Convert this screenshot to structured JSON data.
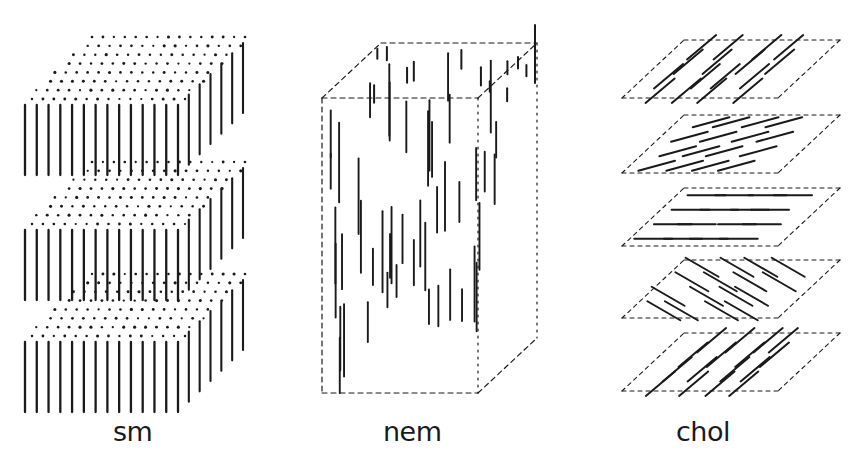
{
  "figure": {
    "ink_color": "#1a1a1a",
    "background": "#ffffff"
  },
  "panels": [
    {
      "id": "smectic",
      "label": "sm",
      "label_pos": [
        113,
        418
      ],
      "layers": 3,
      "layer_tops": [
        43,
        168,
        280
      ],
      "layer_height": 70,
      "front_x": [
        25,
        178
      ],
      "depth_dx": 65,
      "depth_dy": -62,
      "front_rods": 14,
      "side_rods": 6
    },
    {
      "id": "nematic",
      "label": "nem",
      "label_pos": [
        383,
        418
      ],
      "box_front": {
        "x": 322,
        "y": 98,
        "w": 156,
        "h": 295
      },
      "depth_dx": 59,
      "depth_dy": -55
    },
    {
      "id": "cholesteric",
      "label": "chol",
      "label_pos": [
        676,
        418
      ],
      "planes": [
        {
          "y_top": 40,
          "angle_deg": -40
        },
        {
          "y_top": 115,
          "angle_deg": -15
        },
        {
          "y_top": 188,
          "angle_deg": 0
        },
        {
          "y_top": 260,
          "angle_deg": 30
        },
        {
          "y_top": 333,
          "angle_deg": -40
        }
      ],
      "plane_x": [
        622,
        840
      ],
      "plane_height": 58,
      "plane_skew": 62
    }
  ]
}
